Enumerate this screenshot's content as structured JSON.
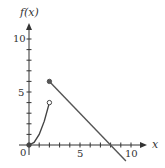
{
  "chart_data": {
    "type": "line",
    "title": "",
    "xlabel": "x",
    "ylabel": "f(x)",
    "xlim": [
      0,
      11
    ],
    "ylim": [
      -1.5,
      11.5
    ],
    "x_ticks": [
      1,
      2,
      3,
      4,
      5,
      6,
      7,
      8,
      9,
      10
    ],
    "y_ticks": [
      1,
      2,
      3,
      4,
      5,
      6,
      7,
      8,
      9,
      10
    ],
    "x_tick_labels": {
      "0": "0",
      "5": "5",
      "10": "10"
    },
    "y_tick_labels": {
      "5": "5",
      "10": "10"
    },
    "grid": false,
    "series": [
      {
        "name": "curve",
        "style": "curve",
        "description": "increasing curve from origin to open circle",
        "points": [
          [
            0,
            0
          ],
          [
            0.5,
            0.25
          ],
          [
            1,
            1
          ],
          [
            1.5,
            2.25
          ],
          [
            2,
            4
          ]
        ],
        "start": {
          "x": 0,
          "y": 0,
          "marker": "closed"
        },
        "end": {
          "x": 2,
          "y": 4,
          "marker": "open"
        }
      },
      {
        "name": "line",
        "style": "segment",
        "description": "line with slope -1",
        "points": [
          [
            2,
            6
          ],
          [
            9.5,
            -1.5
          ]
        ],
        "start": {
          "x": 2,
          "y": 6,
          "marker": "closed"
        },
        "end": {
          "x": 9.5,
          "y": -1.5,
          "marker": "none"
        }
      }
    ],
    "colors": {
      "axis": "#333333",
      "curve": "#444444",
      "line": "#555555"
    }
  },
  "labels": {
    "ylabel": "f(x)",
    "xlabel": "x",
    "origin": "0",
    "x5": "5",
    "x10": "10",
    "y5": "5",
    "y10": "10"
  }
}
